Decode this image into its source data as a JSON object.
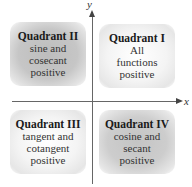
{
  "axes": {
    "x_label": "x",
    "y_label": "y"
  },
  "quadrants": [
    {
      "id": "II",
      "title": "Quadrant II",
      "lines": [
        "sine and",
        "cosecant",
        "positive"
      ],
      "shade": "#c2c2c2"
    },
    {
      "id": "I",
      "title": "Quadrant I",
      "lines": [
        "All",
        "functions",
        "positive"
      ],
      "shade": "#f0f0f0"
    },
    {
      "id": "III",
      "title": "Quadrant III",
      "lines": [
        "tangent and",
        "cotangent",
        "positive"
      ],
      "shade": "#f0f0f0"
    },
    {
      "id": "IV",
      "title": "Quadrant IV",
      "lines": [
        "cosine and",
        "secant",
        "positive"
      ],
      "shade": "#c8c8c8"
    }
  ]
}
